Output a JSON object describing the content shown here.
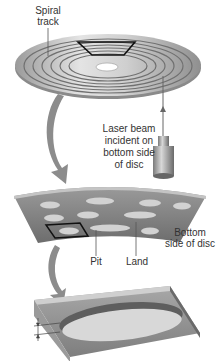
{
  "diagram": {
    "labels": {
      "spiral_track": [
        "Spiral",
        "track"
      ],
      "laser_beam": [
        "Laser beam",
        "incident on",
        "bottom side",
        "of disc"
      ],
      "bottom_side": [
        "Bottom",
        "side of disc"
      ],
      "pit": "Pit",
      "land": "Land"
    },
    "colors": {
      "disc_light": "#e2e2e2",
      "disc_mid": "#b8b8b8",
      "disc_dark": "#8a8a8a",
      "track_lines": "#6e6e6e",
      "arrow": "#8c8c8c",
      "pit_fill": "#d6d6d6",
      "strip_fill": "#7c7c7c",
      "outline": "#111111",
      "text": "#333333"
    }
  }
}
